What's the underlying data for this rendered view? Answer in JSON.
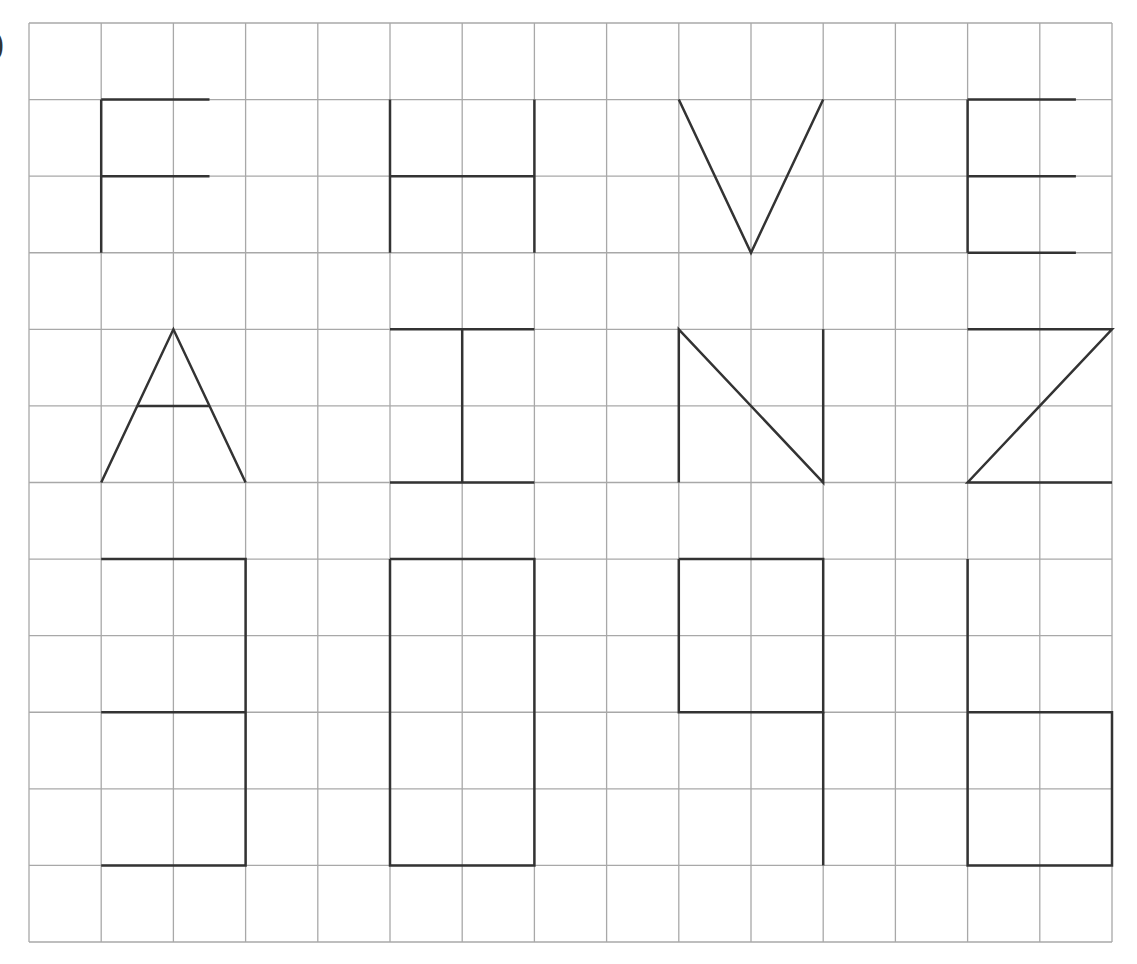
{
  "label": ")",
  "grid": {
    "cols": 15,
    "rows": 12,
    "x0": 29,
    "y0": 23,
    "x1": 1112,
    "y1": 942,
    "line_color": "#a8a8a8",
    "stroke_color": "#333333"
  },
  "figures": [
    {
      "name": "letter-F",
      "paths": [
        [
          [
            1,
            1
          ],
          [
            2.5,
            1
          ]
        ],
        [
          [
            1,
            2
          ],
          [
            2.5,
            2
          ]
        ],
        [
          [
            1,
            1
          ],
          [
            1,
            3
          ]
        ]
      ]
    },
    {
      "name": "letter-H",
      "paths": [
        [
          [
            5,
            1
          ],
          [
            5,
            3
          ]
        ],
        [
          [
            7,
            1
          ],
          [
            7,
            3
          ]
        ],
        [
          [
            5,
            2
          ],
          [
            7,
            2
          ]
        ]
      ]
    },
    {
      "name": "letter-V",
      "paths": [
        [
          [
            9,
            1
          ],
          [
            10,
            3
          ],
          [
            11,
            1
          ]
        ]
      ]
    },
    {
      "name": "letter-E",
      "paths": [
        [
          [
            13,
            1
          ],
          [
            13,
            3
          ]
        ],
        [
          [
            13,
            1
          ],
          [
            14.5,
            1
          ]
        ],
        [
          [
            13,
            2
          ],
          [
            14.5,
            2
          ]
        ],
        [
          [
            13,
            3
          ],
          [
            14.5,
            3
          ]
        ]
      ]
    },
    {
      "name": "letter-A",
      "paths": [
        [
          [
            1,
            6
          ],
          [
            2,
            4
          ],
          [
            3,
            6
          ]
        ],
        [
          [
            1.5,
            5
          ],
          [
            2.5,
            5
          ]
        ]
      ]
    },
    {
      "name": "letter-T-inverted",
      "paths": [
        [
          [
            5,
            4
          ],
          [
            7,
            4
          ]
        ],
        [
          [
            6,
            4
          ],
          [
            6,
            6
          ]
        ],
        [
          [
            5,
            6
          ],
          [
            7,
            6
          ]
        ]
      ]
    },
    {
      "name": "letter-N",
      "paths": [
        [
          [
            9,
            6
          ],
          [
            9,
            4
          ],
          [
            11,
            6
          ],
          [
            11,
            4
          ]
        ]
      ]
    },
    {
      "name": "letter-Z",
      "paths": [
        [
          [
            13,
            4
          ],
          [
            15,
            4
          ],
          [
            13,
            6
          ],
          [
            15,
            6
          ]
        ]
      ]
    },
    {
      "name": "shape-8-partial",
      "paths": [
        [
          [
            1,
            7
          ],
          [
            3,
            7
          ],
          [
            3,
            11
          ],
          [
            1,
            11
          ]
        ],
        [
          [
            1,
            9
          ],
          [
            3,
            9
          ]
        ]
      ]
    },
    {
      "name": "shape-rectangle",
      "paths": [
        [
          [
            5,
            7
          ],
          [
            7,
            7
          ],
          [
            7,
            11
          ],
          [
            5,
            11
          ],
          [
            5,
            7
          ]
        ]
      ]
    },
    {
      "name": "shape-q",
      "paths": [
        [
          [
            9,
            7
          ],
          [
            11,
            7
          ],
          [
            11,
            9
          ],
          [
            9,
            9
          ],
          [
            9,
            7
          ]
        ],
        [
          [
            11,
            9
          ],
          [
            11,
            11
          ]
        ]
      ]
    },
    {
      "name": "shape-b",
      "paths": [
        [
          [
            13,
            7
          ],
          [
            13,
            11
          ],
          [
            15,
            11
          ],
          [
            15,
            9
          ],
          [
            13,
            9
          ]
        ]
      ]
    }
  ]
}
